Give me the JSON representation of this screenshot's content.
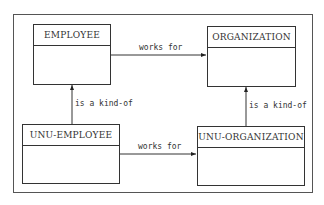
{
  "diagram": {
    "entities": [
      {
        "id": "employee",
        "label": "EMPLOYEE"
      },
      {
        "id": "organization",
        "label": "ORGANIZATION"
      },
      {
        "id": "unu-employee",
        "label": "UNU-EMPLOYEE"
      },
      {
        "id": "unu-organization",
        "label": "UNU-ORGANIZATION"
      }
    ],
    "relations": [
      {
        "from": "employee",
        "to": "organization",
        "label": "works for"
      },
      {
        "from": "unu-employee",
        "to": "unu-organization",
        "label": "works for"
      },
      {
        "from": "unu-employee",
        "to": "employee",
        "label": "is a kind-of"
      },
      {
        "from": "unu-organization",
        "to": "organization",
        "label": "is a kind-of"
      }
    ]
  }
}
